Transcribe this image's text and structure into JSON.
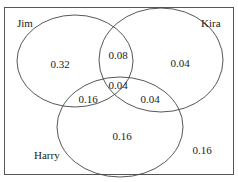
{
  "diagram": {
    "type": "venn",
    "sets": [
      "Jim",
      "Kira",
      "Harry"
    ],
    "regions": {
      "jim_only": "0.32",
      "kira_only": "0.04",
      "harry_only": "0.16",
      "jim_kira_only": "0.08",
      "jim_harry_only": "0.16",
      "kira_harry_only": "0.04",
      "all_three": "0.04",
      "none": "0.16"
    }
  }
}
